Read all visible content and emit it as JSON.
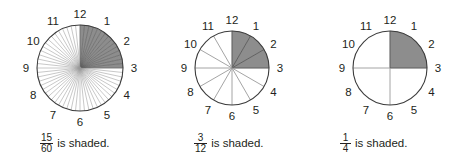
{
  "page": {
    "background": "#ffffff",
    "ink": "#231f20",
    "shade_color": "#8d8d8d",
    "line_color": "#9a9a9a",
    "outline_color": "#3c3c3c"
  },
  "caption_suffix": "is shaded.",
  "figures": [
    {
      "id": "clock-60ths",
      "center_x": 80,
      "center_y": 68,
      "radius": 43,
      "label_radius": 54,
      "divisions": 60,
      "shaded_divisions": 15,
      "shaded_start_division": 0,
      "hour_labels": [
        "12",
        "1",
        "2",
        "3",
        "4",
        "5",
        "6",
        "7",
        "8",
        "9",
        "10",
        "11"
      ],
      "fraction": {
        "numerator": "15",
        "denominator": "60"
      },
      "caption_text": "is shaded.",
      "caption_x": 40,
      "caption_y": 133
    },
    {
      "id": "clock-12ths",
      "center_x": 232,
      "center_y": 68,
      "radius": 37,
      "label_radius": 48,
      "divisions": 12,
      "shaded_divisions": 3,
      "shaded_start_division": 0,
      "hour_labels": [
        "12",
        "1",
        "2",
        "3",
        "4",
        "5",
        "6",
        "7",
        "8",
        "9",
        "10",
        "11"
      ],
      "fraction": {
        "numerator": "3",
        "denominator": "12"
      },
      "caption_text": "is shaded.",
      "caption_x": 194,
      "caption_y": 133
    },
    {
      "id": "clock-fourths",
      "center_x": 390,
      "center_y": 68,
      "radius": 37,
      "label_radius": 48,
      "divisions": 4,
      "shaded_divisions": 1,
      "shaded_start_division": 0,
      "hour_labels": [
        "12",
        "1",
        "2",
        "3",
        "4",
        "5",
        "6",
        "7",
        "8",
        "9",
        "10",
        "11"
      ],
      "fraction": {
        "numerator": "1",
        "denominator": "4"
      },
      "caption_text": "is shaded.",
      "caption_x": 340,
      "caption_y": 133
    }
  ],
  "chart_data": {
    "type": "pie",
    "title": "",
    "charts": [
      {
        "name": "15/60 shaded",
        "total_slices": 60,
        "shaded_slices": 15,
        "fraction_value": 0.25,
        "labels": [
          "12",
          "1",
          "2",
          "3",
          "4",
          "5",
          "6",
          "7",
          "8",
          "9",
          "10",
          "11"
        ],
        "values": [
          5,
          5,
          5,
          5,
          5,
          5,
          5,
          5,
          5,
          5,
          5,
          5
        ]
      },
      {
        "name": "3/12 shaded",
        "total_slices": 12,
        "shaded_slices": 3,
        "fraction_value": 0.25,
        "labels": [
          "12",
          "1",
          "2",
          "3",
          "4",
          "5",
          "6",
          "7",
          "8",
          "9",
          "10",
          "11"
        ],
        "values": [
          1,
          1,
          1,
          1,
          1,
          1,
          1,
          1,
          1,
          1,
          1,
          1
        ]
      },
      {
        "name": "1/4 shaded",
        "total_slices": 4,
        "shaded_slices": 1,
        "fraction_value": 0.25,
        "labels": [
          "12",
          "1",
          "2",
          "3",
          "4",
          "5",
          "6",
          "7",
          "8",
          "9",
          "10",
          "11"
        ],
        "values": [
          3,
          3,
          3,
          3
        ]
      }
    ],
    "legend": []
  }
}
